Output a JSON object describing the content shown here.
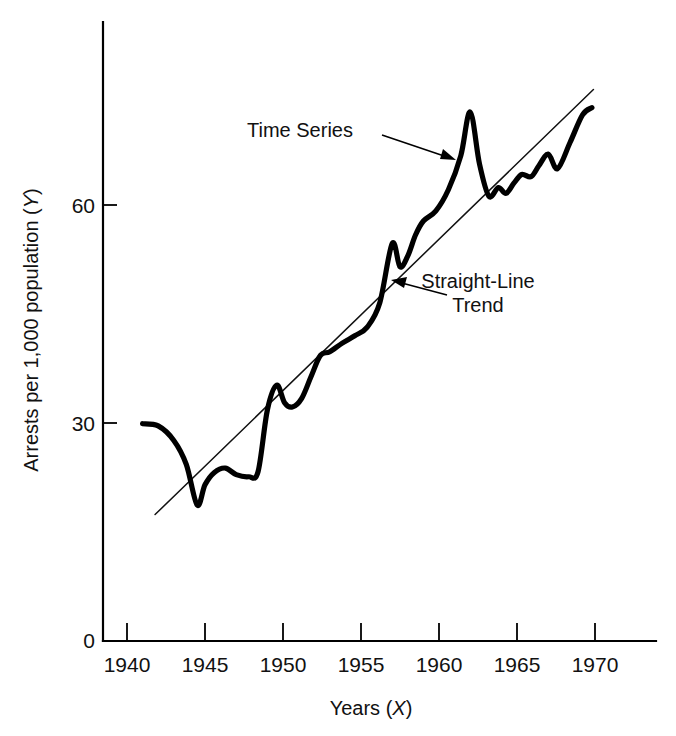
{
  "figure": {
    "background_color": "#ffffff",
    "ink_color": "#000000"
  },
  "chart_data": {
    "type": "line",
    "title": "",
    "subtitle": "",
    "xlabel": "Years (X)",
    "xlabel_plain": "Years",
    "xlabel_symbol": "X",
    "ylabel": "Arrests per 1,000 population (Y)",
    "ylabel_plain": "Arrests per 1,000 population",
    "ylabel_symbol": "Y",
    "xlim": [
      1938.5,
      1973.0
    ],
    "ylim": [
      0,
      78
    ],
    "xticks": [
      1940,
      1945,
      1950,
      1955,
      1960,
      1965,
      1970
    ],
    "xticklabels": [
      "1940",
      "1945",
      "1950",
      "1955",
      "1960",
      "1965",
      "1970"
    ],
    "yticks": [
      0,
      30,
      60
    ],
    "yticklabels": [
      "0",
      "30",
      "60"
    ],
    "grid": false,
    "legend": "none",
    "series": [
      {
        "name": "Time Series",
        "style": "thick-solid-curve",
        "x": [
          1941.0,
          1942.0,
          1943.0,
          1943.8,
          1944.5,
          1945.0,
          1945.6,
          1946.3,
          1947.0,
          1947.8,
          1948.4,
          1949.0,
          1949.6,
          1950.1,
          1950.6,
          1951.2,
          1951.8,
          1952.4,
          1953.0,
          1953.8,
          1954.6,
          1955.4,
          1956.2,
          1957.0,
          1957.5,
          1958.0,
          1958.5,
          1959.0,
          1959.8,
          1960.6,
          1961.4,
          1962.0,
          1962.6,
          1963.2,
          1963.8,
          1964.3,
          1964.8,
          1965.3,
          1965.9,
          1966.4,
          1967.0,
          1967.6,
          1968.4,
          1969.2,
          1969.8
        ],
        "y": [
          29.9,
          29.6,
          27.6,
          24.3,
          18.7,
          21.5,
          23.2,
          23.8,
          22.9,
          22.6,
          23.3,
          31.8,
          35.2,
          32.8,
          32.2,
          33.4,
          36.4,
          39.3,
          39.8,
          41.0,
          42.0,
          43.2,
          46.5,
          54.7,
          51.5,
          53.0,
          55.9,
          57.8,
          59.2,
          62.1,
          66.8,
          72.8,
          65.6,
          61.2,
          62.4,
          61.6,
          63.0,
          64.2,
          63.9,
          65.4,
          67.0,
          65.0,
          68.6,
          72.4,
          73.4
        ]
      },
      {
        "name": "Straight-Line Trend",
        "style": "thin-solid-line",
        "x": [
          1941.8,
          1969.9
        ],
        "y": [
          17.4,
          75.9
        ]
      }
    ],
    "annotations": [
      {
        "id": "time-series-annotation",
        "text": "Time Series",
        "text_line_1": "Time Series",
        "text_line_2": "",
        "points_to_series": "Time Series",
        "points_to_x": 1962.0,
        "points_to_y": 70.0
      },
      {
        "id": "trend-annotation",
        "text": "Straight-Line Trend",
        "text_line_1": "Straight-Line",
        "text_line_2": "Trend",
        "points_to_series": "Straight-Line Trend",
        "points_to_x": 1956.6,
        "points_to_y": 48.0
      }
    ]
  }
}
